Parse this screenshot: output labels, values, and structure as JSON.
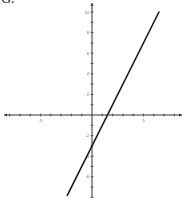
{
  "figure_label": "G.",
  "chart_data": {
    "type": "line",
    "title": "",
    "xlabel": "",
    "ylabel": "",
    "xlim": [
      -8.5,
      8.5
    ],
    "ylim": [
      -8,
      10.5
    ],
    "grid": false,
    "x_tick_labels": [
      "-5",
      "5"
    ],
    "y_tick_labels": [
      "10",
      "8",
      "6",
      "4",
      "2",
      "-2",
      "-4",
      "-6"
    ],
    "series": [
      {
        "name": "y = 2x - 3",
        "equation": "y = 2x - 3",
        "slope": 2,
        "intercept": -3,
        "x": [
          -2.4,
          6.5
        ],
        "y": [
          -7.8,
          10
        ]
      }
    ],
    "line_color": "#1a1a1a",
    "axis_color": "#333333"
  }
}
